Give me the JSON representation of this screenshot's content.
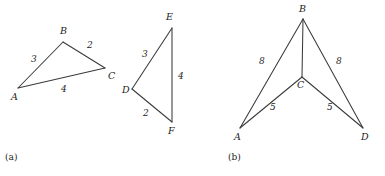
{
  "figure": {
    "background_color": "#ffffff",
    "stroke_color": "#3a3a3a",
    "text_color": "#1c1c1c"
  },
  "panel_a": {
    "caption": "(a)",
    "triangle_abc": {
      "vertices": {
        "A": "A",
        "B": "B",
        "C": "C"
      },
      "side_lengths": {
        "AB": "3",
        "BC": "2",
        "AC": "4"
      }
    },
    "triangle_def": {
      "vertices": {
        "D": "D",
        "E": "E",
        "F": "F"
      },
      "side_lengths": {
        "DE": "3",
        "EF": "4",
        "DF": "2"
      }
    }
  },
  "panel_b": {
    "caption": "(b)",
    "figure_abcd": {
      "vertices": {
        "B": "B",
        "C": "C",
        "A": "A",
        "D": "D"
      },
      "side_lengths": {
        "BA": "8",
        "BD": "8",
        "AC": "5",
        "CD": "5"
      }
    }
  }
}
